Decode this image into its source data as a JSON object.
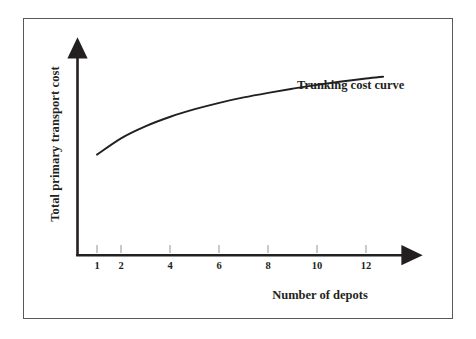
{
  "figure": {
    "background_color": "#ffffff",
    "frame_color": "#555a5e",
    "ink_color": "#231f20"
  },
  "chart_data": {
    "type": "line",
    "title": "",
    "subtitle": "",
    "xlabel": "Number of depots",
    "ylabel": "Total primary transport cost",
    "grid": false,
    "legend_position": "inline-annotation",
    "annotations": [
      {
        "text": "Trunking cost curve",
        "x": 12.2,
        "y": 0.72,
        "anchor": "left"
      }
    ],
    "xticks": [
      1,
      2,
      4,
      6,
      8,
      10,
      12
    ],
    "xtick_labels": [
      "1",
      "2",
      "4",
      "6",
      "8",
      "10",
      "12"
    ],
    "yticks": [],
    "ytick_labels": [],
    "xlim": [
      0,
      14.5
    ],
    "ylim": [
      0,
      1
    ],
    "axis_style": "arrow-headed-L-axes",
    "series": [
      {
        "name": "Trunking cost curve",
        "x": [
          1,
          2,
          3,
          4,
          5,
          6,
          7,
          8,
          9,
          10,
          11,
          12,
          12.7
        ],
        "y": [
          0.505,
          0.588,
          0.648,
          0.695,
          0.733,
          0.765,
          0.792,
          0.815,
          0.836,
          0.855,
          0.872,
          0.887,
          0.896
        ],
        "description": "Concave increasing curve: total primary (trunking) transport cost rises with number of depots at a decreasing rate."
      }
    ]
  },
  "axes": {
    "x_axis_label": "Number of depots",
    "y_axis_label": "Total primary transport cost",
    "tick_labels": [
      "1",
      "2",
      "4",
      "6",
      "8",
      "10",
      "12"
    ]
  },
  "annotation": {
    "curve_label": "Trunking cost curve"
  }
}
